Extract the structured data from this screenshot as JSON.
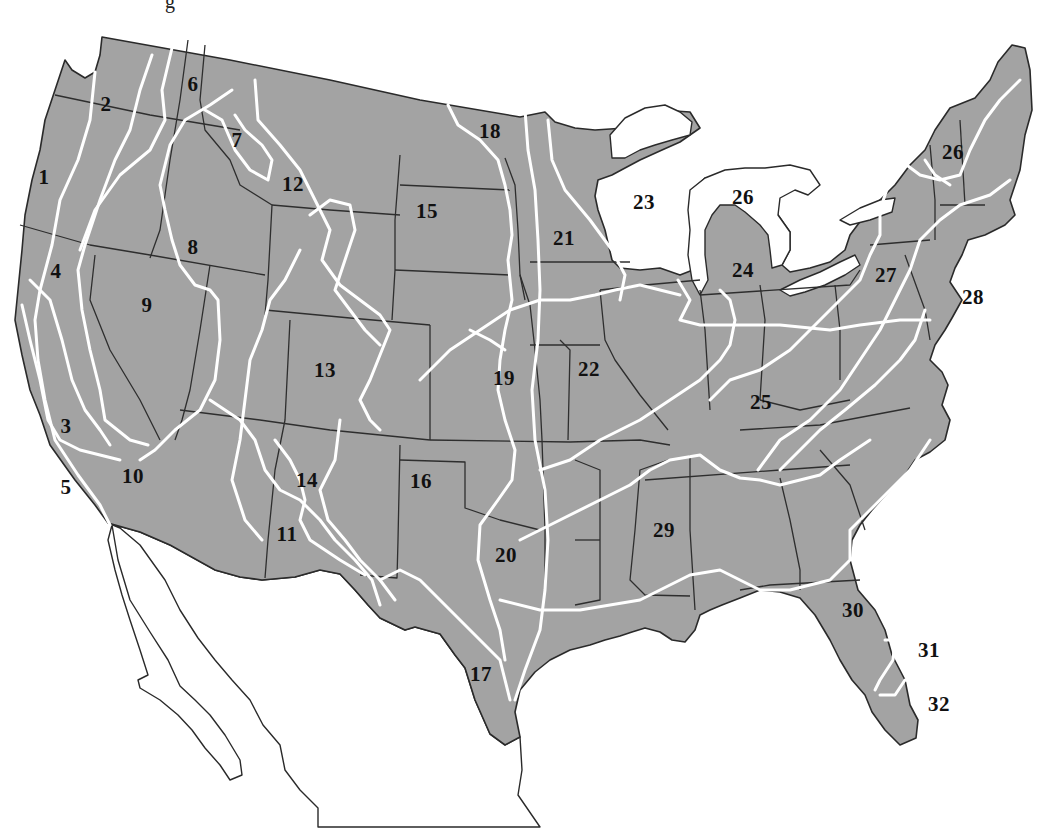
{
  "map": {
    "title_fragment": "g",
    "subject": "Map of the contiguous United States divided into numbered zones",
    "colors": {
      "land": "#a3a3a3",
      "state_border": "#2e2e2e",
      "zone_border": "#ffffff",
      "background": "#ffffff",
      "label": "#111111"
    },
    "zones": [
      {
        "id": "1",
        "label": "1",
        "x": 44,
        "y": 177
      },
      {
        "id": "2",
        "label": "2",
        "x": 106,
        "y": 104
      },
      {
        "id": "3",
        "label": "3",
        "x": 66,
        "y": 426
      },
      {
        "id": "4",
        "label": "4",
        "x": 56,
        "y": 271
      },
      {
        "id": "5",
        "label": "5",
        "x": 66,
        "y": 487
      },
      {
        "id": "6",
        "label": "6",
        "x": 193,
        "y": 84
      },
      {
        "id": "7",
        "label": "7",
        "x": 237,
        "y": 140
      },
      {
        "id": "8",
        "label": "8",
        "x": 193,
        "y": 247
      },
      {
        "id": "9",
        "label": "9",
        "x": 147,
        "y": 305
      },
      {
        "id": "10",
        "label": "10",
        "x": 133,
        "y": 476
      },
      {
        "id": "11",
        "label": "11",
        "x": 287,
        "y": 534
      },
      {
        "id": "12",
        "label": "12",
        "x": 293,
        "y": 184
      },
      {
        "id": "13",
        "label": "13",
        "x": 325,
        "y": 370
      },
      {
        "id": "14",
        "label": "14",
        "x": 307,
        "y": 480
      },
      {
        "id": "15",
        "label": "15",
        "x": 427,
        "y": 211
      },
      {
        "id": "16",
        "label": "16",
        "x": 421,
        "y": 481
      },
      {
        "id": "17",
        "label": "17",
        "x": 481,
        "y": 674
      },
      {
        "id": "18",
        "label": "18",
        "x": 490,
        "y": 131
      },
      {
        "id": "19",
        "label": "19",
        "x": 504,
        "y": 378
      },
      {
        "id": "20",
        "label": "20",
        "x": 506,
        "y": 555
      },
      {
        "id": "21",
        "label": "21",
        "x": 564,
        "y": 238
      },
      {
        "id": "22",
        "label": "22",
        "x": 589,
        "y": 369
      },
      {
        "id": "23",
        "label": "23",
        "x": 644,
        "y": 202
      },
      {
        "id": "24",
        "label": "24",
        "x": 743,
        "y": 270
      },
      {
        "id": "25",
        "label": "25",
        "x": 761,
        "y": 402
      },
      {
        "id": "26a",
        "label": "26",
        "x": 743,
        "y": 197
      },
      {
        "id": "26b",
        "label": "26",
        "x": 953,
        "y": 152
      },
      {
        "id": "27",
        "label": "27",
        "x": 886,
        "y": 275
      },
      {
        "id": "28",
        "label": "28",
        "x": 973,
        "y": 297
      },
      {
        "id": "29",
        "label": "29",
        "x": 664,
        "y": 530
      },
      {
        "id": "30",
        "label": "30",
        "x": 853,
        "y": 610
      },
      {
        "id": "31",
        "label": "31",
        "x": 929,
        "y": 650
      },
      {
        "id": "32",
        "label": "32",
        "x": 939,
        "y": 704
      }
    ]
  }
}
